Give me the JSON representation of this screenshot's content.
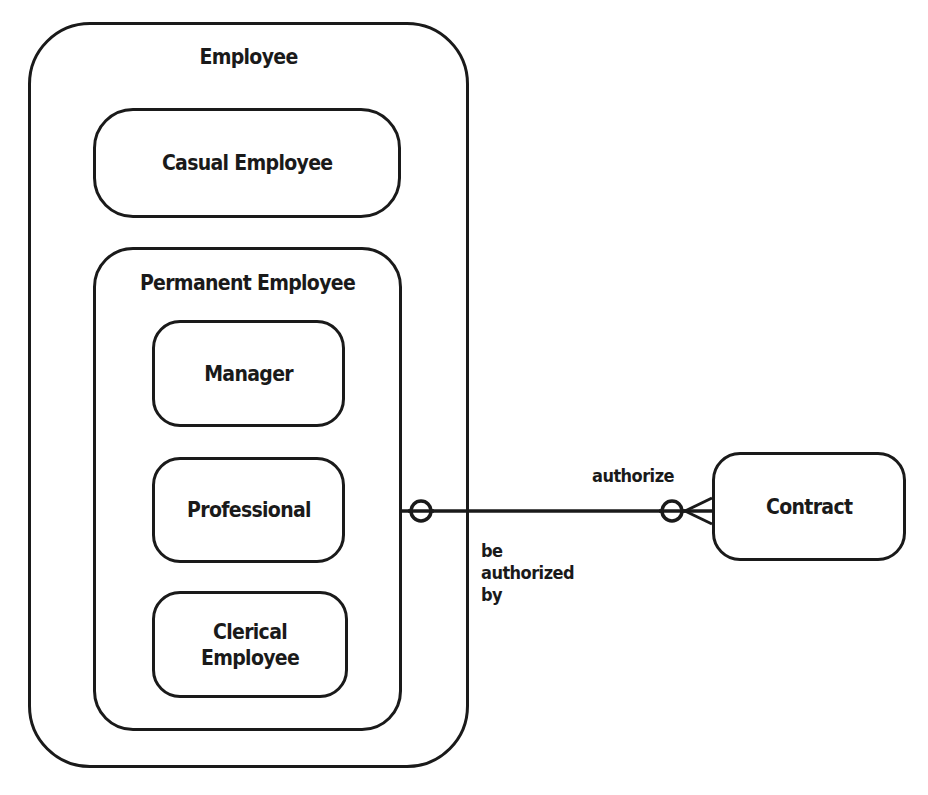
{
  "diagram": {
    "type": "entity-relationship",
    "entities": {
      "employee": {
        "label": "Employee"
      },
      "casual_employee": {
        "label": "Casual Employee"
      },
      "permanent_employee": {
        "label": "Permanent Employee"
      },
      "manager": {
        "label": "Manager"
      },
      "professional": {
        "label": "Professional"
      },
      "clerical_employee": {
        "label_line1": "Clerical",
        "label_line2": "Employee"
      },
      "contract": {
        "label": "Contract"
      }
    },
    "relationship": {
      "from": "Permanent Employee",
      "to": "Contract",
      "label_near_contract": "authorize",
      "label_near_employee_line1": "be",
      "label_near_employee_line2": "authorized",
      "label_near_employee_line3": "by",
      "employee_end": "optional-one",
      "contract_end": "optional-many"
    },
    "colors": {
      "stroke": "#1a1a1a",
      "background": "#ffffff"
    }
  }
}
